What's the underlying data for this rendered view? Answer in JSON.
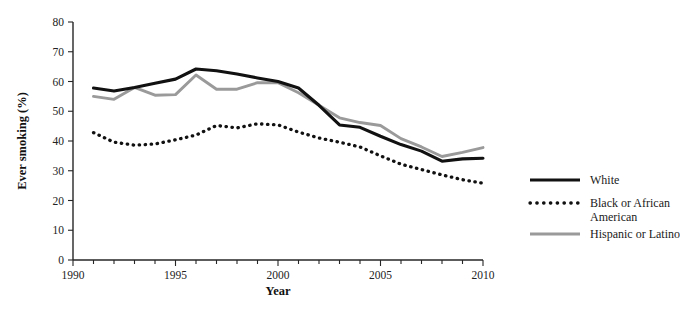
{
  "chart_data": {
    "type": "line",
    "title": "",
    "xlabel": "Year",
    "ylabel": "Ever smoking (%)",
    "xlim": [
      1990,
      2010
    ],
    "ylim": [
      0,
      80
    ],
    "grid": false,
    "legend_position": "right",
    "x": [
      1991,
      1992,
      1993,
      1994,
      1995,
      1996,
      1997,
      1998,
      1999,
      2000,
      2001,
      2002,
      2003,
      2004,
      2005,
      2006,
      2007,
      2008,
      2009,
      2010
    ],
    "xticks": [
      1990,
      1995,
      2000,
      2005,
      2010
    ],
    "xticklabels": [
      "1990",
      "1995",
      "2000",
      "2005",
      "2010"
    ],
    "yticks": [
      0,
      10,
      20,
      30,
      40,
      50,
      60,
      70,
      80
    ],
    "yticklabels": [
      "0",
      "10",
      "20",
      "30",
      "40",
      "50",
      "60",
      "70",
      "80"
    ],
    "series": [
      {
        "name": "White",
        "style": "solid",
        "color": "#111111",
        "values": [
          57.8,
          56.8,
          58.0,
          59.4,
          60.8,
          64.2,
          63.6,
          62.5,
          61.2,
          60.0,
          57.8,
          52.0,
          45.4,
          44.6,
          41.6,
          38.8,
          36.6,
          33.2,
          34.0,
          34.2
        ]
      },
      {
        "name": "Black or African American",
        "style": "dotted",
        "color": "#111111",
        "values": [
          42.8,
          39.6,
          38.6,
          39.0,
          40.4,
          42.0,
          45.2,
          44.4,
          45.8,
          45.4,
          43.0,
          41.0,
          39.6,
          38.0,
          35.0,
          32.2,
          30.4,
          28.6,
          27.0,
          25.8
        ]
      },
      {
        "name": "Hispanic or Latino",
        "style": "solid",
        "color": "#9a9a9a",
        "values": [
          55.0,
          54.0,
          58.0,
          55.4,
          55.6,
          62.2,
          57.4,
          57.4,
          59.6,
          59.6,
          56.2,
          52.0,
          47.8,
          46.2,
          45.2,
          40.8,
          38.0,
          34.8,
          36.2,
          37.8
        ]
      }
    ]
  },
  "axes": {
    "y_title": "Ever smoking (%)",
    "x_title": "Year"
  },
  "legend": {
    "items": [
      {
        "label": "White",
        "style": "solid-black"
      },
      {
        "label": "Black or African",
        "label2": "American",
        "style": "dotted-black"
      },
      {
        "label": "Hispanic or Latino",
        "style": "solid-gray"
      }
    ]
  },
  "colors": {
    "white_series": "#111111",
    "black_series": "#111111",
    "hispanic_series": "#9a9a9a",
    "axis": "#262626",
    "background": "#ffffff"
  }
}
